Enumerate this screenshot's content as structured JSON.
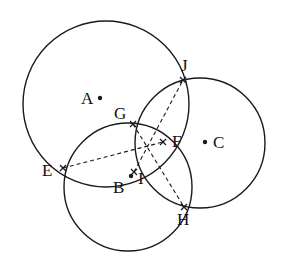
{
  "figure": {
    "background_color": "#ffffff",
    "stroke_color": "#1a1a1a",
    "dash_color": "#1a1a1a",
    "canvas": {
      "width": 282,
      "height": 256
    }
  },
  "circles": [
    {
      "id": "A",
      "label": "A",
      "cx": 106,
      "cy": 104,
      "r": 83,
      "center_dot": true,
      "dot_x": 100,
      "dot_y": 98,
      "label_x": 81,
      "label_y": 90
    },
    {
      "id": "B",
      "label": "B",
      "cx": 128,
      "cy": 187,
      "r": 64,
      "center_dot": true,
      "dot_x": 131,
      "dot_y": 176,
      "label_x": 113,
      "label_y": 179
    },
    {
      "id": "C",
      "label": "C",
      "cx": 200,
      "cy": 143,
      "r": 65,
      "center_dot": true,
      "dot_x": 205,
      "dot_y": 142,
      "label_x": 213,
      "label_y": 134
    }
  ],
  "points": [
    {
      "id": "E",
      "label": "E",
      "x": 63,
      "y": 168,
      "label_x": 42,
      "label_y": 162,
      "marker": "tick"
    },
    {
      "id": "F",
      "label": "F",
      "x": 163,
      "y": 142,
      "label_x": 172,
      "label_y": 133,
      "marker": "tick"
    },
    {
      "id": "G",
      "label": "G",
      "x": 133,
      "y": 124,
      "label_x": 114,
      "label_y": 105,
      "marker": "tick"
    },
    {
      "id": "H",
      "label": "H",
      "x": 184,
      "y": 207,
      "label_x": 177,
      "label_y": 211,
      "marker": "tick"
    },
    {
      "id": "I",
      "label": "I",
      "x": 134,
      "y": 172,
      "label_x": 138,
      "label_y": 170,
      "marker": "tick"
    },
    {
      "id": "J",
      "label": "J",
      "x": 183,
      "y": 80,
      "label_x": 181,
      "label_y": 57,
      "marker": "tick"
    }
  ],
  "dashed_segments": [
    {
      "id": "EF",
      "from": "E",
      "to": "F",
      "x1": 63,
      "y1": 168,
      "x2": 163,
      "y2": 142
    },
    {
      "id": "GH",
      "from": "G",
      "to": "H",
      "x1": 133,
      "y1": 124,
      "x2": 184,
      "y2": 207
    },
    {
      "id": "IJ",
      "from": "I",
      "to": "J",
      "x1": 134,
      "y1": 172,
      "x2": 183,
      "y2": 80
    }
  ],
  "style": {
    "circle_stroke_width": 1.4,
    "dash_stroke_width": 1.1,
    "dash_pattern": "4,3",
    "marker_size": 3,
    "center_dot_radius": 2.2,
    "label_font_size": 17
  }
}
